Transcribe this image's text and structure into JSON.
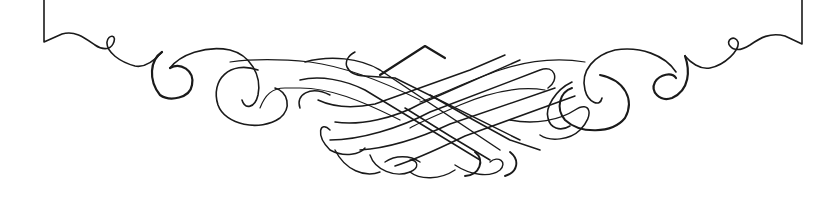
{
  "ornament": {
    "description": "Calligraphic flourish divider with interlaced lattice center",
    "colors": {
      "ink": "#1a1a1a",
      "background": "#ffffff"
    }
  }
}
